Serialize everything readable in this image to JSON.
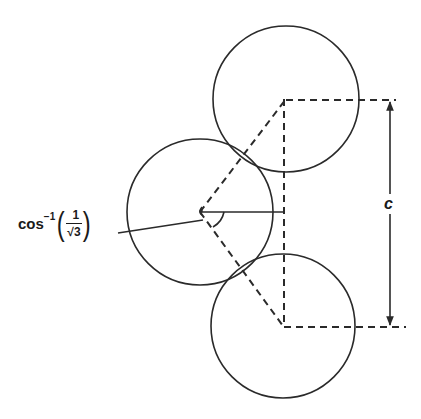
{
  "diagram": {
    "colors": {
      "stroke": "#2a2a2a",
      "background": "#ffffff"
    },
    "circles": [
      {
        "name": "top-circle",
        "cx": 286,
        "cy": 99,
        "r": 73
      },
      {
        "name": "middle-circle",
        "cx": 200,
        "cy": 212,
        "r": 73
      },
      {
        "name": "bottom-circle",
        "cx": 283,
        "cy": 326,
        "r": 72
      }
    ],
    "labels": {
      "angle": {
        "fn": "cos",
        "sup": "−1",
        "open": "(",
        "num": "1",
        "den": "√3",
        "close": ")"
      },
      "dimension": "c"
    }
  }
}
